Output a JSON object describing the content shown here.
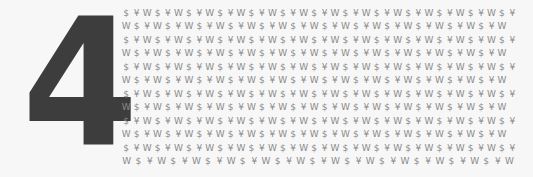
{
  "digit": "4",
  "colors": {
    "background": "#f7f7f7",
    "digit": "#3d3d3d",
    "pattern_text": "#8a8a8a"
  },
  "pattern": {
    "rows": [
      "$¥W$¥W$¥W$¥W$¥W$¥W$¥W$¥W$¥W$¥W$¥W$¥W$¥",
      "W$¥W$¥W$¥W$¥W$¥W$¥W$¥W$¥W$¥W$¥W$¥W$¥W",
      "$¥W$¥W$¥W$¥W$¥W$¥W$¥W$¥W$¥W$¥W$¥W$¥W$¥",
      "W$¥W$¥W$¥W$¥W$¥W$¥W$¥W$¥W$¥W$¥W$¥W$¥W",
      "$¥W$¥W$¥W$¥W$¥W$¥W$¥W$¥W$¥W$¥W$¥W$¥W$¥",
      "W$¥W$¥W$¥W$¥W$¥W$¥W$¥W$¥W$¥W$¥W$¥W$¥W",
      "$¥W$¥W$¥W$¥W$¥W$¥W$¥W$¥W$¥W$¥W$¥W$¥W$¥",
      "W$¥W$¥W$¥W$¥W$¥W$¥W$¥W$¥W$¥W$¥W$¥W$¥W",
      "$¥W$¥W$¥W$¥W$¥W$¥W$¥W$¥W$¥W$¥W$¥W$¥W$¥",
      "W$¥W$¥W$¥W$¥W$¥W$¥W$¥W$¥W$¥W$¥W$¥W$¥W",
      "$¥W$¥W$¥W$¥W$¥W$¥W$¥W$¥W$¥W$¥W$¥W$¥W$¥",
      "W$¥W$¥W$¥W$¥W$¥W$¥W$¥W$¥W$¥W$¥W$¥W"
    ]
  }
}
